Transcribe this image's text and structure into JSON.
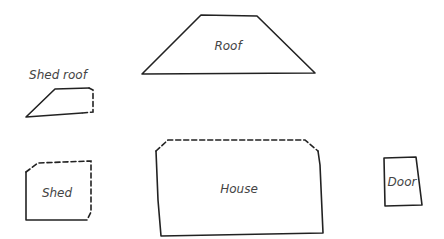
{
  "diagram": {
    "type": "hand-drawn component sketch",
    "shapes": [
      {
        "id": "roof",
        "label": "Roof",
        "shape": "trapezoid",
        "border": "solid"
      },
      {
        "id": "shed-roof",
        "label": "Shed roof",
        "shape": "trapezoid",
        "border": "solid with dashed right edge",
        "label_position": "above"
      },
      {
        "id": "shed",
        "label": "Shed",
        "shape": "rectangle",
        "border": "solid left/bottom, dashed top/right"
      },
      {
        "id": "house",
        "label": "House",
        "shape": "rectangle",
        "border": "solid sides/bottom, dashed top"
      },
      {
        "id": "door",
        "label": "Door",
        "shape": "rectangle",
        "border": "solid"
      }
    ],
    "colors": {
      "stroke": "#222222",
      "text": "#444444",
      "background": "#ffffff"
    }
  }
}
